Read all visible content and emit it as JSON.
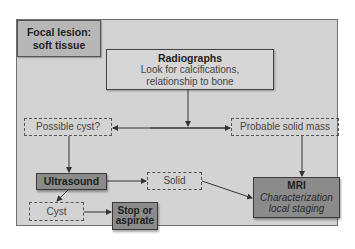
{
  "diagram": {
    "title": "Focal lesion: soft tissue",
    "title_lines": [
      "Focal lesion:",
      "soft tissue"
    ],
    "nodes": {
      "radiographs": {
        "heading": "Radiographs",
        "lines": [
          "Look for calcifications,",
          "relationship to bone"
        ]
      },
      "possible_cyst": {
        "label": "Possible cyst?"
      },
      "probable_solid_mass": {
        "label": "Probable solid mass"
      },
      "ultrasound": {
        "label": "Ultrasound"
      },
      "solid": {
        "label": "Solid"
      },
      "cyst": {
        "label": "Cyst"
      },
      "stop_or_aspirate": {
        "lines": [
          "Stop or",
          "aspirate"
        ]
      },
      "mri": {
        "heading": "MRI",
        "lines": [
          "Characterization",
          "local staging"
        ]
      }
    },
    "edges": [
      {
        "from": "Radiographs",
        "to": "Possible cyst?"
      },
      {
        "from": "Radiographs",
        "to": "Probable solid mass"
      },
      {
        "from": "Possible cyst?",
        "to": "Ultrasound"
      },
      {
        "from": "Ultrasound",
        "to": "Solid"
      },
      {
        "from": "Ultrasound",
        "to": "Cyst"
      },
      {
        "from": "Cyst",
        "to": "Stop or aspirate"
      },
      {
        "from": "Solid",
        "to": "MRI"
      },
      {
        "from": "Probable solid mass",
        "to": "MRI"
      }
    ],
    "colors": {
      "frame_bg": "#d3d3d3",
      "title_bg": "#b7b7b7",
      "action_bg": "#8b8b8b",
      "line": "#333333"
    }
  }
}
